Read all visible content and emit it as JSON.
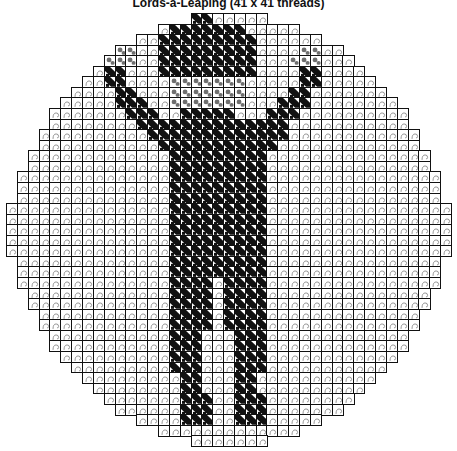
{
  "title": "Lords-a-Leaping (41 x 41 threads)",
  "draft": {
    "threads_x": 41,
    "threads_y": 41,
    "colors": {
      "line": "#111111",
      "background": "#ffffff",
      "curl": "#8a8a8a",
      "figure": "#111111",
      "hand": "#6e6e6e"
    },
    "row_starts": [
      17,
      14,
      12,
      10,
      9,
      8,
      7,
      6,
      5,
      4,
      4,
      3,
      3,
      2,
      2,
      1,
      1,
      1,
      0,
      0,
      0,
      0,
      0,
      1,
      1,
      1,
      2,
      2,
      3,
      3,
      4,
      4,
      5,
      6,
      7,
      8,
      9,
      10,
      12,
      14,
      17
    ],
    "pattern": [
      ".................dd......................",
      "...............ddddddd...................",
      "..............ddddddddd..................",
      "..........gg..ddddddddd....gg............",
      ".........ggg..ddddddddd...ggg............",
      ".........dd...ddddddddd....dd............",
      ".........dd....ggggggg.....dd............",
      "..........dd...ggggggg....dd.............",
      "..........ddd..ggggggg...ddd.............",
      "...........ddd..ddddd...ddd..............",
      "............dddddddddddddd...............",
      ".............ddddddddddddd...............",
      "..............ddddddddddd................",
      "...............ddddddddd.................",
      "...............ddddddddd.................",
      "...............ddddddddd.................",
      "...............ddddddddd.................",
      "...............ddddddddd.................",
      "...............ddddddddd.................",
      "...............ddddddddd.................",
      "...............ddddddddd.................",
      "...............ddddddddd.................",
      "...............ddddddddd.................",
      "...............ddddddddd.................",
      "...............ddddddddd.................",
      "...............dddd.dddd.................",
      "...............dddd.dddd.................",
      "...............dddd.dddd.................",
      "...............dddd.dddd.................",
      "...............dddd.dddd.................",
      "...............ddd...ddd.................",
      "...............ddd...ddd.................",
      "...............ddd...ddd.................",
      "...............ddd...ddd.................",
      "................dd...dd..................",
      "................dd...dd..................",
      "................ddd..ddd.................",
      "................ddd..ddd.................",
      "................ddd..ddd.................",
      ".........................................",
      "........................................."
    ]
  }
}
